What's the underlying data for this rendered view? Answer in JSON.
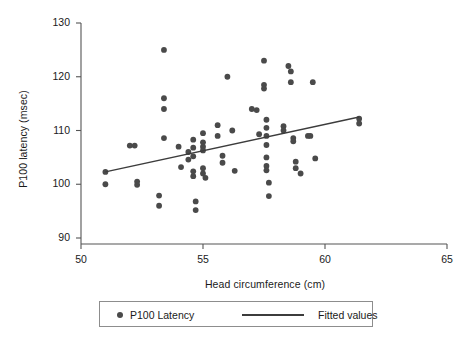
{
  "chart_data": {
    "type": "scatter",
    "title": "",
    "xlabel": "Head circumference (cm)",
    "ylabel": "P100 latency (msec)",
    "xlim": [
      50,
      65
    ],
    "ylim": [
      90,
      130
    ],
    "xticks": [
      50,
      55,
      60,
      65
    ],
    "yticks": [
      90,
      100,
      110,
      120,
      130
    ],
    "grid": false,
    "legend_position": "bottom-center",
    "series": [
      {
        "name": "P100 Latency",
        "type": "scatter",
        "marker": "circle",
        "color": "#4a4a4a",
        "points": [
          [
            51.0,
            102.3
          ],
          [
            51.0,
            100.0
          ],
          [
            52.0,
            107.2
          ],
          [
            52.2,
            107.2
          ],
          [
            52.3,
            100.5
          ],
          [
            52.3,
            99.9
          ],
          [
            53.4,
            125.0
          ],
          [
            53.4,
            116.0
          ],
          [
            53.4,
            114.0
          ],
          [
            53.4,
            108.6
          ],
          [
            53.2,
            97.9
          ],
          [
            53.2,
            96.0
          ],
          [
            54.0,
            107.0
          ],
          [
            54.1,
            103.2
          ],
          [
            54.4,
            106.0
          ],
          [
            54.4,
            104.6
          ],
          [
            54.6,
            108.3
          ],
          [
            54.6,
            106.8
          ],
          [
            54.6,
            105.2
          ],
          [
            54.6,
            102.4
          ],
          [
            54.6,
            101.5
          ],
          [
            54.7,
            96.8
          ],
          [
            54.7,
            95.2
          ],
          [
            55.0,
            109.5
          ],
          [
            55.0,
            107.8
          ],
          [
            55.0,
            107.0
          ],
          [
            55.0,
            106.3
          ],
          [
            55.0,
            103.0
          ],
          [
            55.0,
            102.0
          ],
          [
            55.1,
            101.2
          ],
          [
            55.6,
            111.0
          ],
          [
            55.6,
            109.0
          ],
          [
            55.8,
            105.3
          ],
          [
            55.8,
            104.0
          ],
          [
            56.0,
            120.0
          ],
          [
            56.2,
            110.0
          ],
          [
            56.3,
            102.5
          ],
          [
            57.0,
            114.0
          ],
          [
            57.2,
            113.8
          ],
          [
            57.3,
            109.3
          ],
          [
            57.5,
            123.0
          ],
          [
            57.5,
            118.5
          ],
          [
            57.5,
            117.8
          ],
          [
            57.6,
            112.0
          ],
          [
            57.6,
            110.5
          ],
          [
            57.6,
            109.0
          ],
          [
            57.6,
            107.3
          ],
          [
            57.6,
            105.0
          ],
          [
            57.6,
            103.4
          ],
          [
            57.6,
            102.6
          ],
          [
            57.7,
            100.3
          ],
          [
            57.7,
            97.8
          ],
          [
            58.3,
            110.8
          ],
          [
            58.3,
            110.0
          ],
          [
            58.5,
            122.0
          ],
          [
            58.6,
            121.0
          ],
          [
            58.6,
            119.0
          ],
          [
            58.7,
            108.6
          ],
          [
            58.7,
            108.0
          ],
          [
            58.8,
            104.2
          ],
          [
            58.8,
            103.0
          ],
          [
            59.0,
            102.0
          ],
          [
            59.3,
            109.0
          ],
          [
            59.4,
            109.0
          ],
          [
            59.5,
            119.0
          ],
          [
            59.6,
            104.8
          ],
          [
            61.4,
            112.2
          ],
          [
            61.4,
            111.3
          ]
        ]
      },
      {
        "name": "Fitted values",
        "type": "line",
        "color": "#3c3c3c",
        "endpoints": [
          [
            51.0,
            102.3
          ],
          [
            61.4,
            112.5
          ]
        ]
      }
    ]
  },
  "legend": {
    "point_label": "P100 Latency",
    "line_label": "Fitted values"
  },
  "colors": {
    "marker": "#4a4a4a",
    "line": "#3c3c3c",
    "axis": "#555555",
    "text": "#1a1a1a"
  }
}
